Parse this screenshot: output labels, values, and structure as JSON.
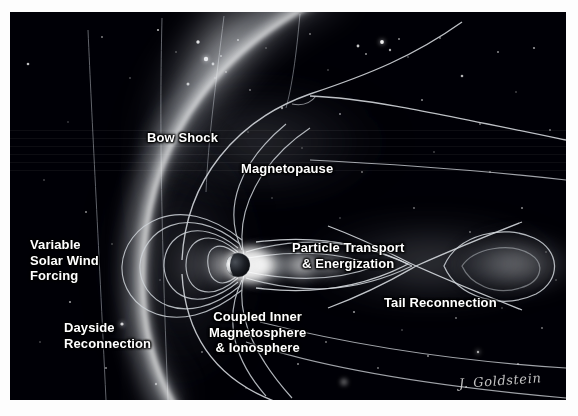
{
  "figure": {
    "background_color": "#000006",
    "page_color": "#fdfdfd",
    "label_color": "#ffffff",
    "signature": "J. Goldstein"
  },
  "labels": {
    "bow_shock": "Bow Shock",
    "magnetopause": "Magnetopause",
    "variable_solar_wind": "Variable\nSolar Wind\nForcing",
    "dayside_reconnection": "Dayside\nReconnection",
    "coupled_inner": "Coupled Inner\nMagnetosphere\n& Ionosphere",
    "particle_transport": "Particle Transport\n& Energization",
    "tail_reconnection": "Tail Reconnection"
  },
  "diagram": {
    "earth": {
      "cx": 228,
      "cy": 253,
      "r": 12
    },
    "features": [
      "solar-wind-imf-lines",
      "bow-shock-arc",
      "magnetopause-boundary",
      "magnetotail-lobes",
      "dipole-field-lines",
      "ring-current-plasma",
      "tail-x-line",
      "plasmoid",
      "starfield"
    ]
  }
}
